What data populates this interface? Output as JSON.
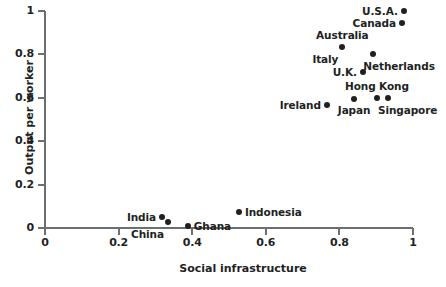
{
  "chart_data": {
    "type": "scatter",
    "title": "",
    "xlabel": "Social infrastructure",
    "ylabel": "Output per worker",
    "xlim": [
      0,
      1
    ],
    "ylim": [
      0,
      1
    ],
    "xticks": [
      "0",
      "0.2",
      "0.4",
      "0.6",
      "0.8",
      "1"
    ],
    "xtick_values": [
      0,
      0.2,
      0.4,
      0.6,
      0.8,
      1
    ],
    "yticks": [
      "0",
      "0.2",
      "0.4",
      "0.6",
      "0.8",
      "1"
    ],
    "ytick_values": [
      0,
      0.2,
      0.4,
      0.6,
      0.8,
      1
    ],
    "grid": false,
    "legend": "none",
    "marker_color": "#231f20",
    "points": [
      {
        "label": "U.S.A.",
        "x": 0.975,
        "y": 1.0,
        "label_pos": "left"
      },
      {
        "label": "Canada",
        "x": 0.97,
        "y": 0.945,
        "label_pos": "left"
      },
      {
        "label": "Australia",
        "x": 0.808,
        "y": 0.835,
        "label_pos": "above"
      },
      {
        "label": "Italy",
        "x": 0.808,
        "y": 0.835,
        "label_pos": "below-left"
      },
      {
        "label": "Netherlands",
        "x": 0.892,
        "y": 0.8,
        "label_pos": "below-right"
      },
      {
        "label": "U.K.",
        "x": 0.864,
        "y": 0.72,
        "label_pos": "left"
      },
      {
        "label": "Hong Kong",
        "x": 0.902,
        "y": 0.6,
        "label_pos": "above"
      },
      {
        "label": "Singapore",
        "x": 0.932,
        "y": 0.6,
        "label_pos": "below-right"
      },
      {
        "label": "Japan",
        "x": 0.84,
        "y": 0.595,
        "label_pos": "below"
      },
      {
        "label": "Ireland",
        "x": 0.766,
        "y": 0.565,
        "label_pos": "left"
      },
      {
        "label": "Indonesia",
        "x": 0.527,
        "y": 0.075,
        "label_pos": "right"
      },
      {
        "label": "Ghana",
        "x": 0.388,
        "y": 0.01,
        "label_pos": "right"
      },
      {
        "label": "China",
        "x": 0.334,
        "y": 0.028,
        "label_pos": "below-left"
      },
      {
        "label": "India",
        "x": 0.318,
        "y": 0.052,
        "label_pos": "left"
      }
    ]
  }
}
